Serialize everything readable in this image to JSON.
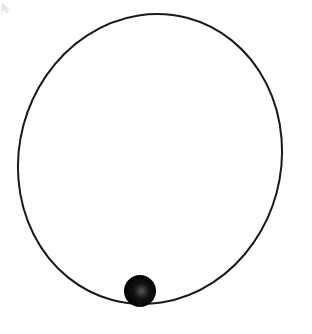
{
  "diagram": {
    "type": "orbit",
    "background": "#ffffff",
    "orbit": {
      "shape": "ellipse",
      "cx": 150,
      "cy": 159,
      "rx": 131,
      "ry": 146,
      "rotation_deg": 15,
      "stroke": "#1a1a1a",
      "stroke_width": 2
    },
    "body": {
      "shape": "sphere",
      "cx": 140,
      "cy": 291,
      "r": 16,
      "fill": "#0a0a0a",
      "highlight": "#555555"
    },
    "cursor": {
      "x": 2,
      "y": 3
    }
  }
}
